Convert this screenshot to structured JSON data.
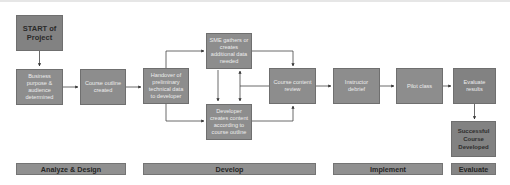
{
  "diagram": {
    "boxes": {
      "start": "START of Project",
      "business": "Business purpose & audience determined",
      "outline": "Course outline created",
      "handover": "Handover of preliminary technical data to developer",
      "sme": "SME gathers or creates additional data needed",
      "developer": "Developer creates content according to course outline",
      "review": "Course content review",
      "debrief": "Instructor debrief",
      "pilot": "Pilot class",
      "evaluate_results": "Evaluate results",
      "success": "Successful Course Developed"
    },
    "phases": {
      "analyze": "Analyze & Design",
      "develop": "Develop",
      "implement": "Implement",
      "evaluate": "Evaluate"
    },
    "colors": {
      "box_fill": "#8d8d8d",
      "box_border": "#6f6f6f",
      "dark_box_fill": "#828282",
      "arrow": "#333333"
    }
  }
}
